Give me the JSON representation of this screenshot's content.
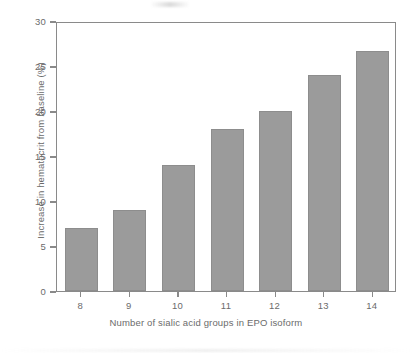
{
  "chart_data": {
    "type": "bar",
    "title": "",
    "xlabel": "Number of sialic acid groups in EPO isoform",
    "ylabel": "Increase in hematocrit from baseline (%)",
    "categories": [
      "8",
      "9",
      "10",
      "11",
      "12",
      "13",
      "14"
    ],
    "values": [
      7,
      9,
      14,
      18,
      20,
      24,
      26.7
    ],
    "ylim": [
      0,
      30
    ],
    "yticks": [
      "0",
      "5",
      "10",
      "15",
      "20",
      "25",
      "30"
    ],
    "ytick_values": [
      0,
      5,
      10,
      15,
      20,
      25,
      30
    ],
    "xticks": [
      "8",
      "9",
      "10",
      "11",
      "12",
      "13",
      "14"
    ],
    "grid": false,
    "legend": null,
    "legend_position": "none",
    "bar_color": "#9b9b9b",
    "bar_edge_color": "#8d8d8d",
    "axis_color": "#8a8a8a",
    "text_color": "#6b6b6b",
    "background": "#ffffff",
    "series": [
      {
        "name": "Increase in hematocrit from baseline (%)",
        "values": [
          7,
          9,
          14,
          18,
          20,
          24,
          26.7
        ]
      }
    ]
  }
}
